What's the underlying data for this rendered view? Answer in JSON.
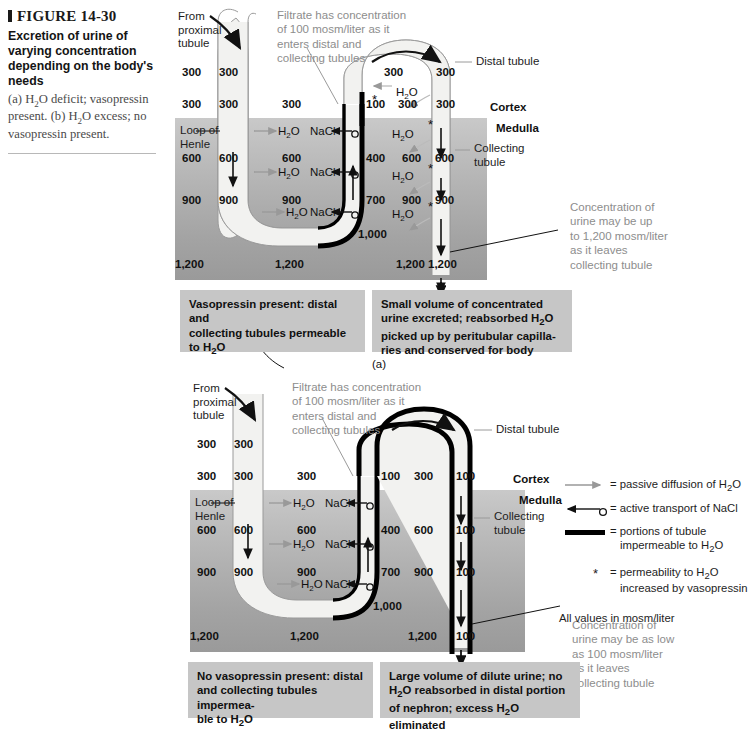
{
  "caption": {
    "figure_number": "FIGURE 14-30",
    "title": "Excretion of urine of varying concentration depending on the body's needs",
    "subtitle_a": "(a) H2O deficit; vasopressin present.",
    "subtitle_b": "(b) H2O excess; no vasopressin present."
  },
  "common": {
    "from_proximal_tubule": "From\nproximal\ntubule",
    "filtrate_note": "Filtrate has concentration\nof 100 mosm/liter as it\nenters distal and\ncollecting tubules",
    "distal_tubule": "Distal tubule",
    "cortex": "Cortex",
    "medulla": "Medulla",
    "loop_of_henle": "Loop of\nHenle",
    "collecting_tubule": "Collecting\ntubule",
    "h2o": "H2O",
    "nacl": "NaCl",
    "star": "*"
  },
  "panel_a": {
    "label": "(a)",
    "interstitial_values": [
      "300",
      "300",
      "600",
      "900",
      "1,200"
    ],
    "descending_limb_values": [
      "300",
      "300",
      "600",
      "900",
      "1,200"
    ],
    "loop_bottom_values": [
      "300",
      "600",
      "900",
      "1,200"
    ],
    "ascending_limb_values": [
      "100",
      "400",
      "700",
      "1,000"
    ],
    "distal_tubule_top_values": [
      "300",
      "300"
    ],
    "early_distal_values": [
      "300",
      "300"
    ],
    "right_interstitial_values": [
      "600",
      "900",
      "1,200"
    ],
    "collecting_tubule_values": [
      "300",
      "600",
      "900",
      "1,200"
    ],
    "h2o_labels_loop": [
      "H2O",
      "H2O",
      "H2O"
    ],
    "nacl_labels": [
      "NaCl",
      "NaCl",
      "NaCl"
    ],
    "h2o_labels_collecting": [
      "H2O",
      "H2O",
      "H2O",
      "H2O"
    ],
    "urine_note": "Concentration of\nurine may be up\nto 1,200 mosm/liter\nas it leaves\ncollecting tubule",
    "box_left": "Vasopressin present: distal and collecting tubules permeable to H2O",
    "box_right": "Small volume of concentrated urine excreted; reabsorbed H2O picked up by peritubular capilla-ries and conserved for body"
  },
  "panel_b": {
    "label": "(b)",
    "interstitial_values": [
      "300",
      "300",
      "600",
      "900",
      "1,200"
    ],
    "descending_limb_values": [
      "300",
      "300",
      "600",
      "900",
      "1,200"
    ],
    "loop_bottom_values": [
      "300",
      "600",
      "900",
      "1,200"
    ],
    "ascending_limb_values": [
      "100",
      "400",
      "700",
      "1,000"
    ],
    "distal_tubule_values": [
      "300",
      "100"
    ],
    "right_interstitial_values": [
      "300",
      "600",
      "900",
      "1,200"
    ],
    "collecting_tubule_values": [
      "100",
      "100",
      "100",
      "100"
    ],
    "h2o_labels_loop": [
      "H2O",
      "H2O",
      "H2O"
    ],
    "nacl_labels": [
      "NaCl",
      "NaCl",
      "NaCl"
    ],
    "urine_note": "Concentration of\nurine may be as low\nas 100 mosm/liter\nas it leaves\ncollecting tubule",
    "box_left": "No vasopressin present: distal and collecting tubules impermea-ble to H2O",
    "box_right": "Large volume of dilute urine; no H2O reabsorbed in distal portion of nephron; excess H2O eliminated"
  },
  "legend": {
    "items": [
      "= passive diffusion of H2O",
      "= active transport of NaCl",
      "= portions of tubule impermeable to H2O",
      "= permeability to H2O increased by vasopressin"
    ],
    "footer": "All values in mosm/liter"
  },
  "colors": {
    "medulla_top": "#c9c9c9",
    "medulla_bottom": "#9a9a9a",
    "tubule_fill": "#f2f2f0",
    "impermeable": "#000000",
    "box_bg": "#c6c6c6",
    "note_gray": "#8d8d8d"
  }
}
